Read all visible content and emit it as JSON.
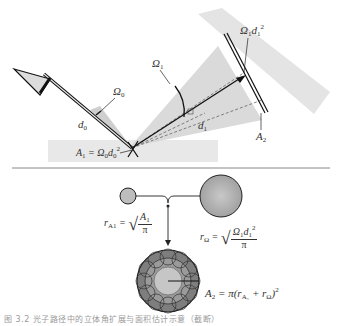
{
  "diagram": {
    "top_panel": {
      "labels": {
        "omega0": "Ω",
        "omega0_sub": "0",
        "omega1": "Ω",
        "omega1_sub": "1",
        "d0": "d",
        "d0_sub": "0",
        "d1": "d",
        "d1_sub": "1",
        "a1_eq": "A",
        "a1_sub": "1",
        "a1_rhs": " = Ω",
        "a1_rhs_sub": "0",
        "a1_rhs_d": "d",
        "a1_rhs_d_sub": "0",
        "a1_rhs_d_sup": "2",
        "omega1_d1sq": "Ω",
        "omega1_d1sq_sub": "1",
        "omega1_d1sq_d": "d",
        "omega1_d1sq_d_sub": "1",
        "omega1_d1sq_sup": "2",
        "a2": "A",
        "a2_sub": "2"
      },
      "colors": {
        "beam_fill": "#d8d8d8",
        "surface_fill": "#e6e6e6",
        "line": "#222222",
        "dashed": "#666666"
      }
    },
    "bottom_panel": {
      "labels": {
        "r_a1": "r",
        "r_a1_sub": "A",
        "r_a1_subsub": "1",
        "r_a1_num": "A",
        "r_a1_num_sub": "1",
        "r_a1_den": "π",
        "r_omega": "r",
        "r_omega_sub": "Ω",
        "r_omega_num": "Ω",
        "r_omega_num_sub": "1",
        "r_omega_num_d": "d",
        "r_omega_num_d_sub": "1",
        "r_omega_num_sup": "2",
        "r_omega_den": "π",
        "a2_formula_lhs": "A",
        "a2_formula_lhs_sub": "2",
        "a2_formula_rhs": " = π(r",
        "a2_formula_rhs_sub1": "A₁",
        "a2_formula_plus": " + r",
        "a2_formula_rhs_sub2": "Ω",
        "a2_formula_close": ")",
        "a2_formula_sup": "2"
      },
      "colors": {
        "small_circle": "#bdbdbd",
        "large_circle": "#a8a8a8",
        "ring_outer": "#7a7a7a",
        "ring_inner": "#c4c4c4"
      }
    },
    "caption": "图 3.2  光子路径中的立体角扩展与面积估计示意（截断）"
  }
}
